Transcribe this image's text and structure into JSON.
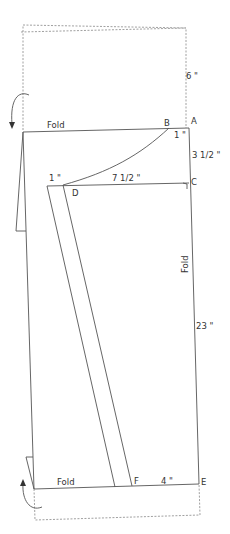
{
  "diagram": {
    "type": "sewing-pattern",
    "points": {
      "A": "A",
      "B": "B",
      "C": "C",
      "D": "D",
      "E": "E",
      "F": "F"
    },
    "fold_labels": {
      "top": "Fold",
      "right": "Fold",
      "bottom": "Fold"
    },
    "measurements": {
      "top_extension": "6 \"",
      "b_offset": "1 \"",
      "a_to_c": "3 1/2 \"",
      "d_offset": "1 \"",
      "d_to_c": "7 1/2 \"",
      "c_to_e": "23 \"",
      "f_to_e": "4 \""
    },
    "line_color": "#555555",
    "dashed_color": "#888888"
  }
}
